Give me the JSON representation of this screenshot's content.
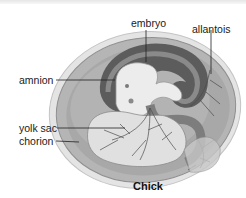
{
  "figure": {
    "caption": "Chick",
    "labels": [
      {
        "id": "embryo",
        "text": "embryo"
      },
      {
        "id": "allantois",
        "text": "allantois"
      },
      {
        "id": "amnion",
        "text": "amnion"
      },
      {
        "id": "yolk_sac",
        "text": "yolk sac"
      },
      {
        "id": "chorion",
        "text": "chorion"
      }
    ]
  },
  "colors": {
    "background": "#ffffff",
    "shell_outer": "#d9d9d9",
    "albumen": "#bdbdbd",
    "chorion_band": "#a6a6a6",
    "amnion_dark": "#5a5a5a",
    "embryo": "#e8e8e8",
    "yolk": "#dcdcdc",
    "vessel": "#4a4a4a",
    "leader_line": "#222222",
    "text": "#1a1a1a"
  }
}
